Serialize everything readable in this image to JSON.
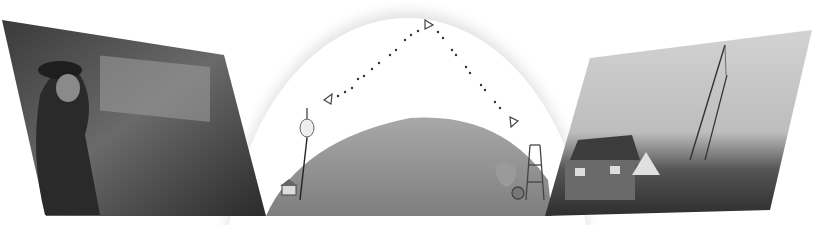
{
  "illustration": {
    "left_photo": {
      "subject": "seated man in hat and suit beside fireplace",
      "tone": "black-and-white"
    },
    "center_diagram": {
      "subject": "radio signal reflecting across globe",
      "signal_path": [
        "transmitter",
        "peak",
        "receiver"
      ],
      "markers": [
        "triangle-left",
        "triangle-top",
        "triangle-right"
      ],
      "globe_color": "#8c8c8c",
      "dot_color": "#333333"
    },
    "right_photo": {
      "subject": "stone house and tall sailing ship masts at harbor",
      "tone": "black-and-white"
    }
  }
}
